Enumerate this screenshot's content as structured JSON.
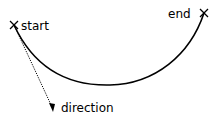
{
  "diagram": {
    "labels": {
      "start": "start",
      "end": "end",
      "direction": "direction"
    },
    "points": {
      "start": {
        "x": 14,
        "y": 25,
        "marker": "x-mark"
      },
      "end": {
        "x": 204,
        "y": 13,
        "marker": "x-mark"
      },
      "direction_tip": {
        "x": 53,
        "y": 112
      }
    },
    "colors": {
      "stroke": "#000000",
      "background": "#ffffff"
    }
  }
}
